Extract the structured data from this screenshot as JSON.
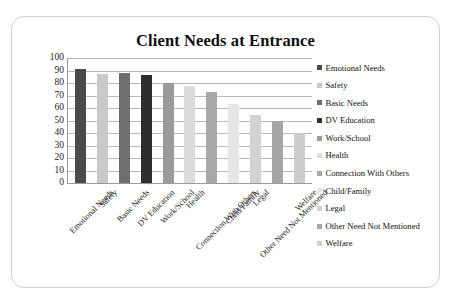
{
  "card": {
    "background": "#ffffff",
    "border_color": "#cfcfcf"
  },
  "chart_data": {
    "type": "bar",
    "title": "Client Needs at Entrance",
    "xlabel": "",
    "ylabel": "",
    "ylim": [
      0,
      100
    ],
    "ytick_step": 10,
    "yticks": [
      100,
      90,
      80,
      70,
      60,
      50,
      40,
      30,
      20,
      10,
      0
    ],
    "grid": true,
    "legend_position": "right",
    "categories": [
      "Emotional Needs",
      "Safety",
      "Basic Needs",
      "DV Education",
      "Work/School",
      "Health",
      "Connection With Others",
      "Child/Family",
      "Legal",
      "Other Need Not Mentioned",
      "Welfare"
    ],
    "values": [
      91,
      87.5,
      88,
      86.5,
      80,
      77.5,
      72.5,
      63,
      54.5,
      49.5,
      40
    ],
    "bar_colors": [
      "#4a4a4a",
      "#c9c9c9",
      "#6e6e6e",
      "#2e2e2e",
      "#9b9b9b",
      "#dcdcdc",
      "#a9a9a9",
      "#e6e6e6",
      "#d2d2d2",
      "#a6a6a6",
      "#cdcdcd"
    ],
    "series": [
      {
        "name": "Client Needs at Entrance",
        "values": [
          91,
          87.5,
          88,
          86.5,
          80,
          77.5,
          72.5,
          63,
          54.5,
          49.5,
          40
        ]
      }
    ],
    "legend": [
      {
        "label": "Emotional Needs",
        "color": "#4a4a4a"
      },
      {
        "label": "Safety",
        "color": "#c9c9c9"
      },
      {
        "label": "Basic Needs",
        "color": "#6e6e6e"
      },
      {
        "label": "DV Education",
        "color": "#2e2e2e"
      },
      {
        "label": "Work/School",
        "color": "#9b9b9b"
      },
      {
        "label": "Health",
        "color": "#dcdcdc"
      },
      {
        "label": "Connection With Others",
        "color": "#a9a9a9"
      },
      {
        "label": "Child/Family",
        "color": "#e6e6e6"
      },
      {
        "label": "Legal",
        "color": "#d2d2d2"
      },
      {
        "label": "Other Need Not Mentioned",
        "color": "#a6a6a6"
      },
      {
        "label": "Welfare",
        "color": "#cdcdcd"
      }
    ]
  }
}
